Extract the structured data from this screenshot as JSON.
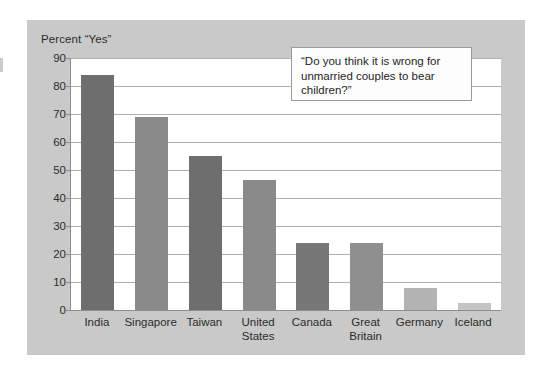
{
  "chart_data": {
    "type": "bar",
    "title": "Percent “Yes”",
    "xlabel": "",
    "ylabel": "Percent “Yes”",
    "ylim": [
      0,
      90
    ],
    "ytick_step": 10,
    "yticks": [
      0,
      10,
      20,
      30,
      40,
      50,
      60,
      70,
      80,
      90
    ],
    "grid": true,
    "legend_position": "none",
    "categories": [
      "India",
      "Singapore",
      "Taiwan",
      "United States",
      "Canada",
      "Great Britain",
      "Germany",
      "Iceland"
    ],
    "category_lines": [
      [
        "India"
      ],
      [
        "Singapore"
      ],
      [
        "Taiwan"
      ],
      [
        "United",
        "States"
      ],
      [
        "Canada"
      ],
      [
        "Great",
        "Britain"
      ],
      [
        "Germany"
      ],
      [
        "Iceland"
      ]
    ],
    "values": [
      84,
      69,
      55,
      46.5,
      24,
      24,
      8,
      2.5
    ],
    "bar_colors": [
      "#6e6e6e",
      "#8a8a8a",
      "#6e6e6e",
      "#8a8a8a",
      "#777777",
      "#8f8f8f",
      "#b3b3b3",
      "#c4c4c4"
    ],
    "annotations": [
      {
        "name": "question-callout",
        "text": "“Do you think it is wrong for unmarried couples to bear children?”",
        "lines": [
          "“Do you think it is wrong for",
          "unmarried couples to bear",
          "children?”"
        ]
      }
    ]
  },
  "colors": {
    "panel_background": "#c9c9c9",
    "plot_background": "#ffffff",
    "gridline": "#b0b0b0",
    "axis_line": "#8d8d8d",
    "text": "#2c2c2c",
    "callout_border": "#9a9a9a",
    "callout_background": "#fdfdfd"
  }
}
